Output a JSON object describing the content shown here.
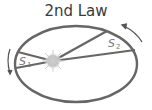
{
  "title": "2nd Law",
  "diagram": {
    "type": "kepler-second-law",
    "orbit_color": "#666666",
    "sun_color": "#bdbdbd",
    "arrow_color": "#555555",
    "areas": [
      {
        "symbol": "S",
        "subscript": "1"
      },
      {
        "symbol": "S",
        "subscript": "2"
      }
    ],
    "direction": "counter-clockwise"
  }
}
